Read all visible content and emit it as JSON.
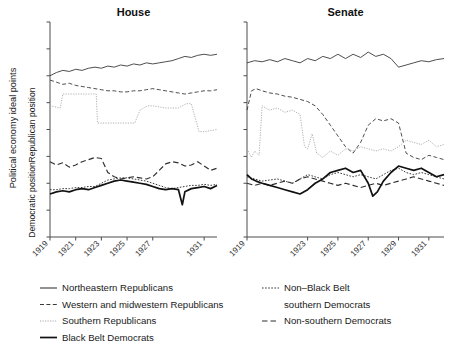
{
  "figure": {
    "y_axis_outer_label": "Political economy ideal points",
    "y_axis_upper_label": "Republican position",
    "y_axis_lower_label": "Democratic position"
  },
  "panels": [
    {
      "name": "house",
      "title": "House",
      "xticks": [
        "1919",
        "1921",
        "1923",
        "1925",
        "1927",
        "1931"
      ]
    },
    {
      "name": "senate",
      "title": "Senate",
      "xticks": [
        "1919",
        "1923",
        "1925",
        "1927",
        "1929",
        "1931"
      ]
    }
  ],
  "legend": {
    "left_column": [
      {
        "label": "Northeastern Republicans",
        "style": "solid-thin",
        "color": "#333333"
      },
      {
        "label": "Western and midwestern Republicans",
        "style": "dashed",
        "color": "#333333"
      },
      {
        "label": "Southern Republicans",
        "style": "dotted",
        "color": "#999999"
      },
      {
        "label": "Black Belt Democrats",
        "style": "solid-thick",
        "color": "#111111"
      }
    ],
    "right_column": [
      {
        "label": "Non–Black Belt",
        "label_line2": "southern Democrats",
        "style": "dotted-dark",
        "color": "#333333"
      },
      {
        "label": "Non-southern Democrats",
        "style": "dashed-long",
        "color": "#333333"
      }
    ]
  },
  "chart_data": {
    "type": "line",
    "title": "",
    "xlabel": "",
    "ylabel": "Political economy ideal points",
    "grid": false,
    "legend_position": "bottom",
    "xlim": [
      1919,
      1932
    ],
    "ylim": [
      -1.0,
      1.0
    ],
    "panels": [
      {
        "panel": "House",
        "xticks": [
          1919,
          1921,
          1923,
          1925,
          1927,
          1931
        ],
        "series": [
          {
            "name": "Northeastern Republicans",
            "style": "solid-thin",
            "x": [
              1919.0,
              1919.5,
              1920.0,
              1920.5,
              1921.0,
              1921.5,
              1922.0,
              1922.5,
              1923.0,
              1923.5,
              1924.0,
              1924.5,
              1925.0,
              1925.5,
              1926.0,
              1926.5,
              1927.0,
              1927.5,
              1928.0,
              1928.5,
              1929.0,
              1929.5,
              1930.0,
              1930.5,
              1931.0,
              1931.5,
              1932.0
            ],
            "y": [
              0.5,
              0.53,
              0.55,
              0.54,
              0.56,
              0.55,
              0.57,
              0.58,
              0.57,
              0.59,
              0.58,
              0.6,
              0.59,
              0.61,
              0.6,
              0.62,
              0.61,
              0.62,
              0.63,
              0.64,
              0.66,
              0.68,
              0.67,
              0.69,
              0.7,
              0.69,
              0.7
            ]
          },
          {
            "name": "Western and midwestern Republicans",
            "style": "dashed",
            "x": [
              1919.0,
              1919.5,
              1920.0,
              1920.5,
              1921.0,
              1921.5,
              1922.0,
              1922.5,
              1923.0,
              1923.5,
              1924.0,
              1924.5,
              1925.0,
              1925.5,
              1926.0,
              1926.5,
              1927.0,
              1927.5,
              1928.0,
              1928.5,
              1929.0,
              1929.5,
              1930.0,
              1930.5,
              1931.0,
              1931.5,
              1932.0
            ],
            "y": [
              0.46,
              0.44,
              0.42,
              0.43,
              0.41,
              0.4,
              0.39,
              0.38,
              0.37,
              0.36,
              0.36,
              0.35,
              0.35,
              0.36,
              0.36,
              0.37,
              0.38,
              0.37,
              0.36,
              0.35,
              0.34,
              0.33,
              0.34,
              0.35,
              0.36,
              0.36,
              0.37
            ]
          },
          {
            "name": "Southern Republicans",
            "style": "dotted",
            "x": [
              1919.0,
              1919.8,
              1920.0,
              1921.0,
              1922.0,
              1922.6,
              1922.7,
              1924.0,
              1925.0,
              1925.6,
              1926.0,
              1926.6,
              1927.0,
              1928.0,
              1929.0,
              1929.6,
              1930.0,
              1930.6,
              1931.0,
              1932.0
            ],
            "y": [
              0.22,
              0.2,
              0.33,
              0.33,
              0.33,
              0.33,
              0.06,
              0.06,
              0.06,
              0.06,
              0.18,
              0.22,
              0.22,
              0.2,
              0.2,
              0.24,
              0.24,
              -0.02,
              -0.02,
              0.0
            ]
          },
          {
            "name": "Non-southern Democrats",
            "style": "dashed-long",
            "x": [
              1919.0,
              1919.5,
              1920.0,
              1920.5,
              1921.0,
              1921.5,
              1922.0,
              1922.5,
              1923.0,
              1923.5,
              1924.0,
              1924.5,
              1925.0,
              1925.5,
              1926.0,
              1926.5,
              1927.0,
              1927.5,
              1928.0,
              1928.5,
              1929.0,
              1929.5,
              1930.0,
              1930.5,
              1931.0,
              1931.5,
              1932.0
            ],
            "y": [
              -0.3,
              -0.33,
              -0.31,
              -0.35,
              -0.33,
              -0.3,
              -0.28,
              -0.26,
              -0.27,
              -0.4,
              -0.44,
              -0.46,
              -0.45,
              -0.44,
              -0.45,
              -0.46,
              -0.44,
              -0.38,
              -0.32,
              -0.3,
              -0.31,
              -0.34,
              -0.33,
              -0.3,
              -0.34,
              -0.38,
              -0.36
            ]
          },
          {
            "name": "Non–Black Belt southern Democrats",
            "style": "dotted-dark",
            "x": [
              1919.0,
              1919.5,
              1920.0,
              1920.5,
              1921.0,
              1921.5,
              1922.0,
              1922.5,
              1923.0,
              1923.5,
              1924.0,
              1924.5,
              1925.0,
              1925.5,
              1926.0,
              1926.5,
              1927.0,
              1927.5,
              1928.0,
              1928.5,
              1929.0,
              1929.5,
              1930.0,
              1930.5,
              1931.0,
              1931.5,
              1932.0
            ],
            "y": [
              -0.56,
              -0.56,
              -0.55,
              -0.55,
              -0.54,
              -0.54,
              -0.53,
              -0.53,
              -0.5,
              -0.47,
              -0.46,
              -0.45,
              -0.45,
              -0.46,
              -0.47,
              -0.48,
              -0.5,
              -0.52,
              -0.54,
              -0.55,
              -0.54,
              -0.53,
              -0.52,
              -0.52,
              -0.51,
              -0.52,
              -0.51
            ]
          },
          {
            "name": "Black Belt Democrats",
            "style": "solid-thick",
            "x": [
              1919.0,
              1919.5,
              1920.0,
              1920.5,
              1921.0,
              1921.5,
              1922.0,
              1922.5,
              1923.0,
              1923.5,
              1924.0,
              1924.5,
              1925.0,
              1925.5,
              1926.0,
              1926.5,
              1927.0,
              1927.5,
              1928.0,
              1928.5,
              1929.0,
              1929.3,
              1929.5,
              1930.0,
              1930.5,
              1931.0,
              1931.5,
              1932.0
            ],
            "y": [
              -0.6,
              -0.58,
              -0.57,
              -0.58,
              -0.56,
              -0.55,
              -0.56,
              -0.54,
              -0.52,
              -0.5,
              -0.48,
              -0.47,
              -0.48,
              -0.49,
              -0.5,
              -0.51,
              -0.53,
              -0.55,
              -0.56,
              -0.55,
              -0.56,
              -0.7,
              -0.58,
              -0.55,
              -0.54,
              -0.53,
              -0.55,
              -0.52
            ]
          }
        ]
      },
      {
        "panel": "Senate",
        "xticks": [
          1919,
          1923,
          1925,
          1927,
          1929,
          1931
        ],
        "series": [
          {
            "name": "Northeastern Republicans",
            "style": "solid-thin",
            "x": [
              1919.0,
              1919.5,
              1920.0,
              1920.5,
              1921.0,
              1921.5,
              1922.0,
              1922.5,
              1923.0,
              1923.5,
              1924.0,
              1924.5,
              1925.0,
              1925.5,
              1926.0,
              1926.5,
              1927.0,
              1927.5,
              1928.0,
              1928.5,
              1929.0,
              1929.5,
              1930.0,
              1930.5,
              1931.0,
              1931.5,
              1932.0
            ],
            "y": [
              0.62,
              0.64,
              0.63,
              0.65,
              0.63,
              0.66,
              0.64,
              0.62,
              0.66,
              0.64,
              0.68,
              0.66,
              0.7,
              0.66,
              0.7,
              0.67,
              0.72,
              0.68,
              0.7,
              0.66,
              0.58,
              0.6,
              0.62,
              0.64,
              0.63,
              0.65,
              0.66
            ]
          },
          {
            "name": "Western and midwestern Republicans",
            "style": "dashed",
            "x": [
              1919.0,
              1919.3,
              1919.6,
              1920.0,
              1920.5,
              1921.0,
              1921.5,
              1922.0,
              1922.5,
              1923.0,
              1923.5,
              1924.0,
              1924.5,
              1925.0,
              1925.5,
              1926.0,
              1926.5,
              1927.0,
              1927.5,
              1928.0,
              1928.5,
              1929.0,
              1929.5,
              1930.0,
              1930.5,
              1931.0,
              1931.5,
              1932.0
            ],
            "y": [
              0.18,
              0.36,
              0.38,
              0.36,
              0.34,
              0.33,
              0.31,
              0.3,
              0.28,
              0.26,
              0.22,
              0.14,
              0.04,
              -0.06,
              -0.16,
              -0.22,
              -0.12,
              0.04,
              0.1,
              0.08,
              0.1,
              0.06,
              -0.22,
              -0.26,
              -0.28,
              -0.24,
              -0.26,
              -0.28
            ]
          },
          {
            "name": "Southern Republicans",
            "style": "dotted",
            "x": [
              1919.0,
              1919.3,
              1919.5,
              1919.8,
              1920.0,
              1920.5,
              1921.0,
              1921.5,
              1922.0,
              1922.5,
              1922.8,
              1923.0,
              1923.3,
              1923.6,
              1924.0,
              1924.5,
              1925.0,
              1925.5,
              1926.0,
              1926.5,
              1927.0,
              1927.5,
              1928.0,
              1928.5,
              1929.0,
              1929.5,
              1930.0,
              1930.5,
              1931.0,
              1931.5,
              1932.0
            ],
            "y": [
              -0.18,
              -0.26,
              -0.2,
              -0.24,
              0.22,
              0.18,
              0.2,
              0.16,
              0.18,
              0.14,
              -0.16,
              -0.18,
              -0.04,
              -0.22,
              -0.26,
              -0.2,
              -0.24,
              -0.18,
              -0.2,
              -0.16,
              -0.18,
              -0.2,
              -0.18,
              -0.2,
              -0.16,
              -0.1,
              -0.12,
              -0.14,
              -0.1,
              -0.16,
              -0.14
            ]
          },
          {
            "name": "Non-southern Democrats",
            "style": "dashed-long",
            "x": [
              1919.0,
              1919.5,
              1920.0,
              1920.5,
              1921.0,
              1921.5,
              1922.0,
              1922.5,
              1923.0,
              1923.5,
              1924.0,
              1924.5,
              1925.0,
              1925.5,
              1926.0,
              1926.5,
              1927.0,
              1927.5,
              1928.0,
              1928.5,
              1929.0,
              1929.5,
              1930.0,
              1930.5,
              1931.0,
              1931.5,
              1932.0
            ],
            "y": [
              -0.5,
              -0.52,
              -0.5,
              -0.52,
              -0.5,
              -0.48,
              -0.5,
              -0.46,
              -0.44,
              -0.46,
              -0.48,
              -0.5,
              -0.52,
              -0.5,
              -0.52,
              -0.54,
              -0.52,
              -0.5,
              -0.52,
              -0.5,
              -0.48,
              -0.46,
              -0.44,
              -0.46,
              -0.48,
              -0.5,
              -0.52
            ]
          },
          {
            "name": "Non–Black Belt southern Democrats",
            "style": "dotted-dark",
            "x": [
              1919.0,
              1919.5,
              1920.0,
              1920.5,
              1921.0,
              1921.5,
              1922.0,
              1922.5,
              1923.0,
              1923.5,
              1924.0,
              1924.5,
              1925.0,
              1925.5,
              1926.0,
              1926.5,
              1927.0,
              1927.5,
              1928.0,
              1928.5,
              1929.0,
              1929.5,
              1930.0,
              1930.5,
              1931.0,
              1931.5,
              1932.0
            ],
            "y": [
              -0.44,
              -0.46,
              -0.48,
              -0.47,
              -0.46,
              -0.48,
              -0.5,
              -0.46,
              -0.42,
              -0.44,
              -0.46,
              -0.42,
              -0.4,
              -0.42,
              -0.44,
              -0.42,
              -0.44,
              -0.46,
              -0.42,
              -0.38,
              -0.36,
              -0.4,
              -0.42,
              -0.4,
              -0.42,
              -0.44,
              -0.46
            ]
          },
          {
            "name": "Black Belt Democrats",
            "style": "solid-thick",
            "x": [
              1919.0,
              1919.3,
              1919.6,
              1920.0,
              1920.5,
              1921.0,
              1921.5,
              1922.0,
              1922.5,
              1923.0,
              1923.5,
              1924.0,
              1924.5,
              1925.0,
              1925.5,
              1926.0,
              1926.5,
              1927.0,
              1927.3,
              1927.6,
              1928.0,
              1928.5,
              1929.0,
              1929.5,
              1930.0,
              1930.5,
              1931.0,
              1931.5,
              1932.0
            ],
            "y": [
              -0.42,
              -0.46,
              -0.48,
              -0.5,
              -0.52,
              -0.54,
              -0.56,
              -0.58,
              -0.6,
              -0.56,
              -0.5,
              -0.46,
              -0.4,
              -0.38,
              -0.36,
              -0.4,
              -0.38,
              -0.5,
              -0.62,
              -0.58,
              -0.48,
              -0.4,
              -0.34,
              -0.36,
              -0.38,
              -0.36,
              -0.4,
              -0.44,
              -0.42
            ]
          }
        ]
      }
    ]
  }
}
